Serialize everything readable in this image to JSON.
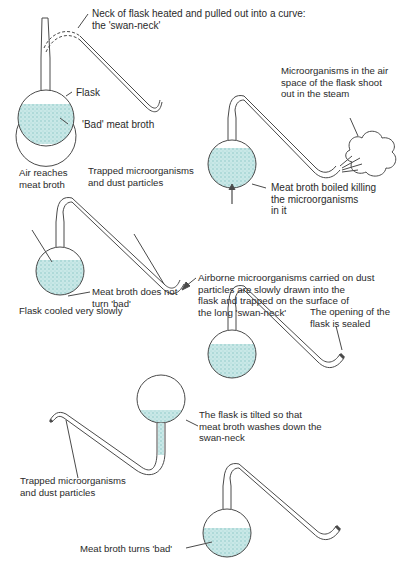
{
  "colors": {
    "line": "#4a4a4a",
    "broth": "#bfe3e2",
    "broth_dot": "#8fc9c8",
    "glass": "#ffffff"
  },
  "step1": {
    "neck_label": [
      "Neck of flask heated and pulled out into a curve:",
      "the 'swan-neck'"
    ],
    "flask_label": "Flask",
    "broth_label": "'Bad' meat broth"
  },
  "step2": {
    "steam_label": [
      "Microorganisms in the air",
      "space of the flask shoot",
      "out in the steam"
    ],
    "boil_label": [
      "Meat broth boiled killing",
      "the microorganisms",
      "in it"
    ]
  },
  "step3": {
    "air_label": [
      "Air reaches",
      "meat broth"
    ],
    "trapped_label": [
      "Trapped microorganisms",
      "and dust particles"
    ],
    "airborne_label": [
      "Airborne microorganisms carried on dust",
      "particles are slowly drawn into the",
      "flask and trapped on the surface of",
      "the long 'swan-neck'"
    ],
    "broth_label": [
      "Meat broth does not",
      "turn 'bad'"
    ],
    "cooled_label": "Flask cooled very slowly"
  },
  "step4": {
    "sealed_label": [
      "The opening of the",
      "flask is sealed"
    ]
  },
  "step5": {
    "tilted_label": [
      "The flask is tilted so that",
      "meat broth washes down the",
      "swan-neck"
    ],
    "trapped_label": [
      "Trapped microorganisms",
      "and dust particles"
    ]
  },
  "step6": {
    "broth_label": "Meat broth turns 'bad'"
  }
}
